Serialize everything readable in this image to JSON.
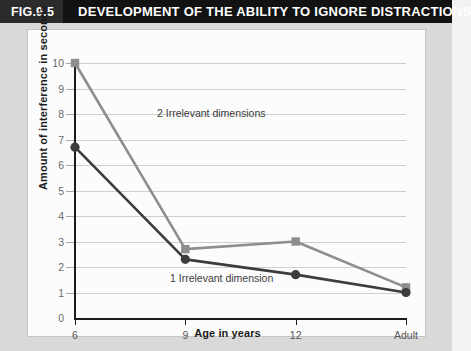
{
  "header": {
    "figure_number": "FIG.9.5",
    "title": "DEVELOPMENT OF THE ABILITY TO IGNORE DISTRACTIONS"
  },
  "source_credit": "Source: Strutt et al. (1975).",
  "chart_data": {
    "type": "line",
    "title": "DEVELOPMENT OF THE ABILITY TO IGNORE DISTRACTIONS",
    "xlabel": "Age in years",
    "ylabel": "Amount of interference in seconds",
    "categories": [
      "6",
      "9",
      "12",
      "Adult"
    ],
    "ylim": [
      0,
      10
    ],
    "yticks": [
      "0",
      "1",
      "2",
      "3",
      "4",
      "5",
      "6",
      "7",
      "8",
      "9",
      "10"
    ],
    "grid": true,
    "legend_position": "inline-annotations",
    "series": [
      {
        "name": "2 Irrelevant dimensions",
        "values": [
          10.0,
          2.7,
          3.0,
          1.2
        ],
        "color": "#8e8e8e",
        "marker": "square"
      },
      {
        "name": "1 Irrelevant dimension",
        "values": [
          6.7,
          2.3,
          1.7,
          1.0
        ],
        "color": "#3c3c3c",
        "marker": "circle"
      }
    ],
    "annotations": [
      {
        "text": "2 Irrelevant dimensions"
      },
      {
        "text": "1 Irrelevant dimension"
      }
    ]
  },
  "colors": {
    "header_bg": "#121212",
    "fig_num_bg": "#2b2b2b",
    "frame_bg": "#d9d9d9",
    "panel_bg": "#fcfcfc",
    "gridline": "#cfcfcf",
    "axis": "#1c1c1c",
    "series_light": "#8e8e8e",
    "series_dark": "#3c3c3c"
  }
}
